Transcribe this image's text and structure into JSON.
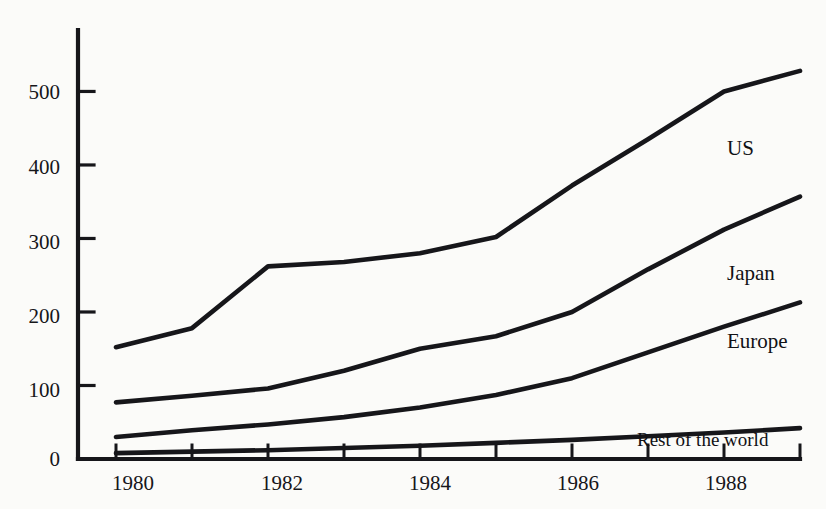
{
  "chart_data": {
    "type": "line",
    "title": "",
    "subtitle": "",
    "xlabel": "",
    "ylabel": "",
    "x": [
      1980,
      1981,
      1982,
      1983,
      1984,
      1985,
      1986,
      1987,
      1988,
      1989
    ],
    "xlim": [
      1979.5,
      1989.0
    ],
    "ylim": [
      0,
      570
    ],
    "yticks": [
      0,
      100,
      200,
      300,
      400,
      500
    ],
    "ytick_labels": [
      "0",
      "100",
      "200",
      "300",
      "400",
      "500"
    ],
    "xticks": [
      1980,
      1981,
      1982,
      1983,
      1984,
      1985,
      1986,
      1987,
      1988,
      1989
    ],
    "xtick_labels": [
      "1980",
      "",
      "1982",
      "",
      "1984",
      "",
      "1986",
      "",
      "1988",
      ""
    ],
    "xtick_labels_shown": [
      "1980",
      "1982",
      "1984",
      "1986",
      "1988"
    ],
    "grid": false,
    "legend": "inline-right",
    "series": [
      {
        "name": "US",
        "label": "US",
        "color": "#16161a",
        "values": [
          152,
          178,
          262,
          268,
          280,
          302,
          372,
          435,
          500,
          528
        ]
      },
      {
        "name": "Japan",
        "label": "Japan",
        "color": "#16161a",
        "values": [
          77,
          86,
          96,
          120,
          150,
          167,
          200,
          258,
          312,
          357
        ]
      },
      {
        "name": "Europe",
        "label": "Europe",
        "color": "#16161a",
        "values": [
          30,
          39,
          47,
          57,
          70,
          87,
          110,
          145,
          180,
          213
        ]
      },
      {
        "name": "Rest of the world",
        "label": "Rest of the world",
        "color": "#16161a",
        "values": [
          8,
          10,
          12,
          15,
          18,
          22,
          26,
          31,
          36,
          42
        ]
      }
    ]
  },
  "axis": {
    "y_axis_name": "value-axis",
    "x_axis_name": "year-axis"
  },
  "labels": {
    "us": "US",
    "japan": "Japan",
    "europe": "Europe",
    "rest": "Rest of the world"
  }
}
